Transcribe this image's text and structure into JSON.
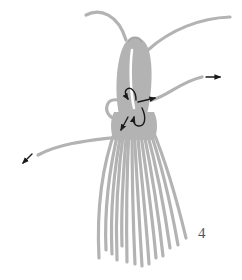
{
  "figure": {
    "type": "tassel knot instruction diagram",
    "step_number": "4",
    "colors": {
      "cord": "#b3b3b3",
      "cord_dark": "#a6a6a6",
      "arrow": "#1a1a1a",
      "background": "#ffffff"
    },
    "elements": [
      {
        "name": "top-left-cord-end",
        "description": "free cord end curving up-left"
      },
      {
        "name": "top-right-cord-end",
        "description": "free cord end curving up-right"
      },
      {
        "name": "folded-loop-head",
        "description": "folded bundle forming tassel head"
      },
      {
        "name": "side-loop",
        "description": "small loop on left side of wrap"
      },
      {
        "name": "working-cord-right",
        "description": "cord pulled out to the right"
      },
      {
        "name": "working-cord-left",
        "description": "cord pulled out to the lower left"
      },
      {
        "name": "tassel-strands",
        "description": "hanging fringe of strands",
        "count": 14
      }
    ],
    "arrows": [
      {
        "name": "arrow-right",
        "direction": "right"
      },
      {
        "name": "arrow-lower-left",
        "direction": "down-left"
      },
      {
        "name": "arrow-loop-down",
        "direction": "curving down"
      },
      {
        "name": "arrow-pull-right",
        "direction": "right"
      },
      {
        "name": "arrow-pull-down-left",
        "direction": "down-left"
      },
      {
        "name": "arrow-curl-up",
        "direction": "curving up"
      }
    ]
  }
}
